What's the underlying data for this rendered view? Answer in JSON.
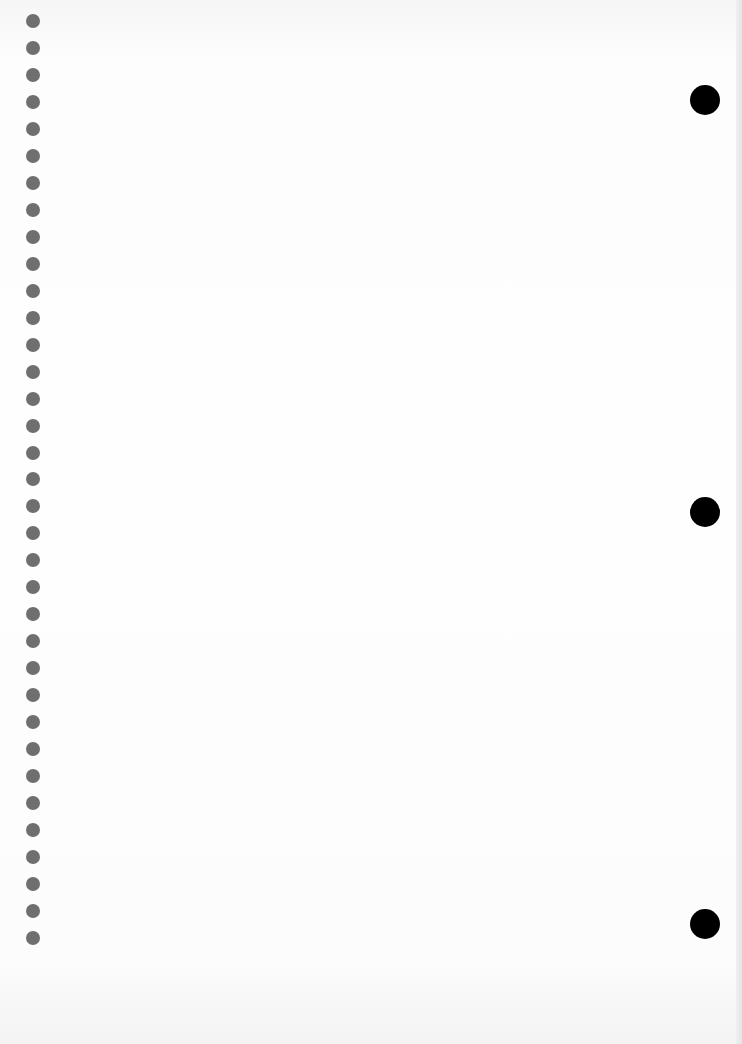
{
  "page": {
    "background": "#fefefe"
  },
  "left_holes": {
    "count": 35,
    "x_center": 33,
    "first_y_center": 21,
    "spacing": 26.97,
    "diameter": 14,
    "color": "#6f6f6f"
  },
  "right_holes": {
    "items": [
      {
        "x_center": 705,
        "y_center": 100
      },
      {
        "x_center": 705,
        "y_center": 512
      },
      {
        "x_center": 705,
        "y_center": 924
      }
    ],
    "diameter": 30,
    "color": "#000000"
  }
}
